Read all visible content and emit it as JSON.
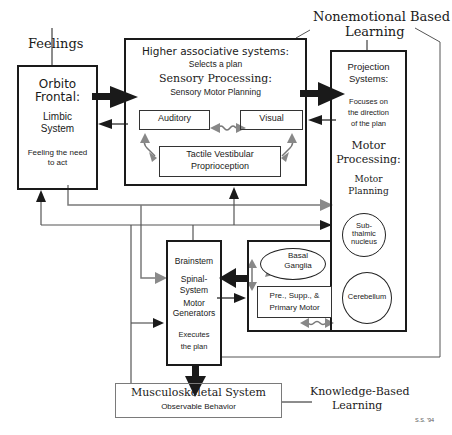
{
  "labels": {
    "feelings": "Feelings",
    "nonemotional_1": "Nonemotional Based",
    "nonemotional_2": "Learning",
    "knowledge_1": "Knowledge-Based",
    "knowledge_2": "Learning",
    "signature": "S.S. '94"
  },
  "orbito": {
    "title_1": "Orbito",
    "title_2": "Frontal:",
    "sub_1": "Limbic",
    "sub_2": "System",
    "desc_1": "Feeling the need",
    "desc_2": "to act"
  },
  "higher": {
    "title": "Higher associative systems:",
    "sub": "Selects a plan",
    "sensory_title": "Sensory Processing:",
    "sensory_sub": "Sensory Motor Planning",
    "auditory": "Auditory",
    "visual": "Visual",
    "tactile_1": "Tactile   Vestibular",
    "tactile_2": "Proprioception"
  },
  "projection": {
    "title_1": "Projection",
    "title_2": "Systems:",
    "desc_1": "Focuses on",
    "desc_2": "the direction",
    "desc_3": "of the plan",
    "motor_1": "Motor",
    "motor_2": "Processing:",
    "planning_1": "Motor",
    "planning_2": "Planning"
  },
  "motor_inner": {
    "basal_1": "Basal",
    "basal_2": "Ganglia",
    "subthalamic_1": "Sub-",
    "subthalamic_2": "thalmic",
    "subthalamic_3": "nucleus",
    "cerebellum": "Cerebellum",
    "premotor_1": "Pre., Supp., &",
    "premotor_2": "Primary  Motor"
  },
  "brainstem": {
    "title": "Brainstem",
    "spinal_1": "Spinal-",
    "spinal_2": "System",
    "motor_1": "Motor",
    "motor_2": "Generators",
    "exec_1": "Executes",
    "exec_2": "the plan"
  },
  "musculo": {
    "title": "Musculoskeletal System",
    "sub": "Observable Behavior"
  },
  "colors": {
    "ink": "#1a1a1a",
    "gray_line": "#7a7a7a"
  }
}
